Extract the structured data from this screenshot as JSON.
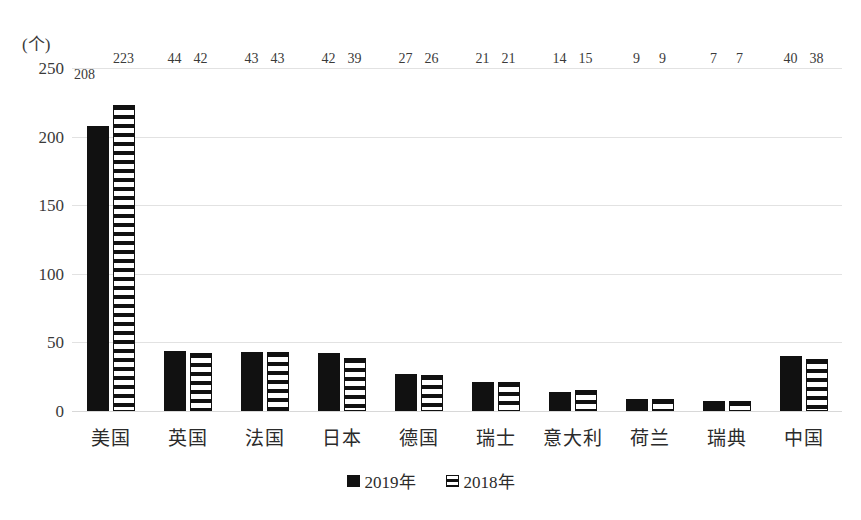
{
  "chart_data": {
    "type": "bar",
    "title": "",
    "xlabel": "",
    "ylabel": "(个)",
    "ylim": [
      0,
      250
    ],
    "yticks": [
      0,
      50,
      100,
      150,
      200,
      250
    ],
    "grid": true,
    "legend_position": "bottom",
    "categories": [
      "美国",
      "英国",
      "法国",
      "日本",
      "德国",
      "瑞士",
      "意大利",
      "荷兰",
      "瑞典",
      "中国"
    ],
    "series": [
      {
        "name": "2019年",
        "style": "solid-black",
        "values": [
          208,
          44,
          43,
          42,
          27,
          21,
          14,
          9,
          7,
          40
        ]
      },
      {
        "name": "2018年",
        "style": "horizontal-stripes",
        "values": [
          223,
          42,
          43,
          39,
          26,
          21,
          15,
          9,
          7,
          38
        ]
      }
    ]
  },
  "axis": {
    "unit_label": "(个)",
    "tick_labels": [
      "250",
      "200",
      "150",
      "100",
      "50",
      "0"
    ]
  },
  "legend": {
    "items": [
      {
        "label": "2019年",
        "swatch": "solid-square-icon"
      },
      {
        "label": "2018年",
        "swatch": "striped-square-icon"
      }
    ]
  }
}
